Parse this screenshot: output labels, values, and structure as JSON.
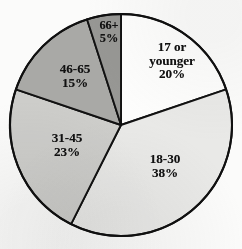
{
  "chart_data": {
    "type": "pie",
    "title": "",
    "subtitle": "",
    "xlabel": "",
    "ylabel": "",
    "legend_position": "none",
    "grid": false,
    "start_angle_deg": 0,
    "direction": "clockwise",
    "categories": [
      "17 or younger",
      "18-30",
      "31-45",
      "46-65",
      "66+"
    ],
    "values": [
      20,
      38,
      23,
      15,
      5
    ],
    "value_unit": "percent",
    "data_labels": [
      "20%",
      "38%",
      "23%",
      "15%",
      "5%"
    ],
    "slices": [
      {
        "category": "17 or younger",
        "value": 20,
        "percent_label": "20%",
        "label_lines": [
          "17 or",
          "younger",
          "20%"
        ],
        "fill": "#fdfdfc",
        "stroke": "#121212"
      },
      {
        "category": "18-30",
        "value": 38,
        "percent_label": "38%",
        "label_lines": [
          "18-30",
          "38%"
        ],
        "fill": "#e9e9e7",
        "stroke": "#121212"
      },
      {
        "category": "31-45",
        "value": 23,
        "percent_label": "23%",
        "label_lines": [
          "31-45",
          "23%"
        ],
        "fill": "#cdcdca",
        "stroke": "#121212"
      },
      {
        "category": "46-65",
        "value": 15,
        "percent_label": "15%",
        "label_lines": [
          "46-65",
          "15%"
        ],
        "fill": "#a9a9a6",
        "stroke": "#121212"
      },
      {
        "category": "66+",
        "value": 5,
        "percent_label": "5%",
        "label_lines": [
          "66+",
          "5%"
        ],
        "fill": "#979794",
        "stroke": "#121212"
      }
    ],
    "geometry": {
      "center_x": 121,
      "center_y": 125,
      "radius": 111
    }
  }
}
